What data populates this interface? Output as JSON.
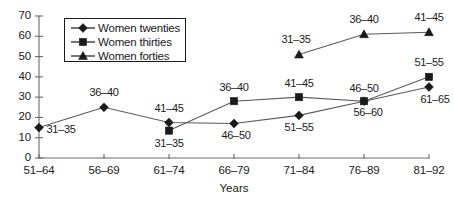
{
  "chart_data": {
    "type": "line",
    "title": "",
    "subtitle": "",
    "xlabel": "Years",
    "ylabel": "",
    "categories": [
      "51–64",
      "56–69",
      "61–74",
      "66–79",
      "71–84",
      "76–89",
      "81–92"
    ],
    "ylim": [
      0,
      70
    ],
    "yticks": [
      0,
      10,
      20,
      30,
      40,
      50,
      60,
      70
    ],
    "ytick_labels": [
      "0",
      "10",
      "20",
      "30",
      "40",
      "50",
      "60",
      "70"
    ],
    "grid": false,
    "legend_position": "upper-left-inset",
    "series": [
      {
        "name": "Women twenties",
        "marker": "diamond",
        "values": [
          15,
          25,
          17.5,
          17,
          21,
          28,
          35
        ],
        "point_labels": [
          "31–35",
          "36–40",
          "41–45",
          "46–50",
          "51–55",
          "56–60",
          "61–65"
        ]
      },
      {
        "name": "Women thirties",
        "marker": "square",
        "values": [
          null,
          null,
          13.5,
          28,
          30,
          28,
          40
        ],
        "point_labels": [
          null,
          null,
          "31–35",
          "36–40",
          "41–45",
          "46–50",
          "51–55"
        ]
      },
      {
        "name": "Women forties",
        "marker": "triangle",
        "values": [
          null,
          null,
          null,
          null,
          51,
          61,
          62
        ],
        "point_labels": [
          null,
          null,
          null,
          null,
          "31–35",
          "36–40",
          "41–45"
        ]
      }
    ]
  },
  "legend": {
    "items": [
      {
        "label": "Women twenties",
        "marker": "diamond"
      },
      {
        "label": "Women thirties",
        "marker": "square"
      },
      {
        "label": "Women forties",
        "marker": "triangle"
      }
    ]
  },
  "colors": {
    "ink": "#1a1a1a",
    "axis": "#6b6b6b",
    "series_line": "#5a5a5a",
    "background": "#ffffff"
  }
}
